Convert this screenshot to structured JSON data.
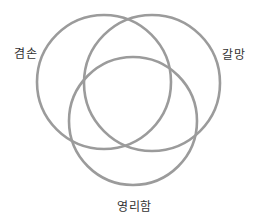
{
  "diagram": {
    "type": "venn",
    "stroke_color": "#9b9b9b",
    "sets": [
      {
        "id": "left",
        "label": "겸손",
        "cx": 104,
        "cy": 82,
        "r": 67
      },
      {
        "id": "right",
        "label": "갈망",
        "cx": 152,
        "cy": 83,
        "r": 68
      },
      {
        "id": "bottom",
        "label": "영리함",
        "cx": 133,
        "cy": 121,
        "r": 64
      }
    ]
  }
}
